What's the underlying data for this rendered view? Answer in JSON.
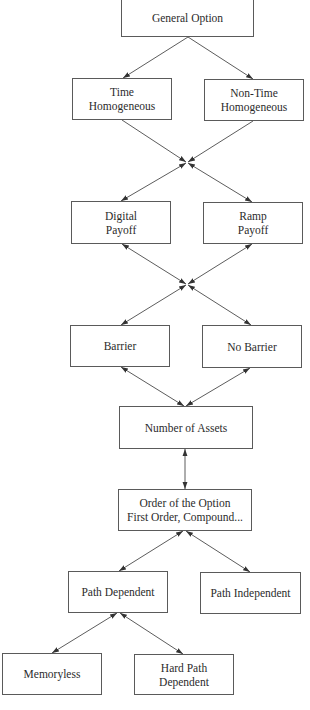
{
  "diagram": {
    "title": "",
    "nodes": {
      "general_option": {
        "lines": [
          "General Option"
        ]
      },
      "time_homogeneous": {
        "lines": [
          "Time",
          "Homogeneous"
        ]
      },
      "non_time_homogeneous": {
        "lines": [
          "Non-Time",
          "Homogeneous"
        ]
      },
      "digital_payoff": {
        "lines": [
          "Digital",
          "Payoff"
        ]
      },
      "ramp_payoff": {
        "lines": [
          "Ramp",
          "Payoff"
        ]
      },
      "barrier": {
        "lines": [
          "Barrier"
        ]
      },
      "no_barrier": {
        "lines": [
          "No Barrier"
        ]
      },
      "number_of_assets": {
        "lines": [
          "Number of Assets"
        ]
      },
      "order_of_option": {
        "lines": [
          "Order of the Option",
          "First Order, Compound..."
        ]
      },
      "path_dependent": {
        "lines": [
          "Path Dependent"
        ]
      },
      "path_independent": {
        "lines": [
          "Path Independent"
        ]
      },
      "memoryless": {
        "lines": [
          "Memoryless"
        ]
      },
      "hard_path_dependent": {
        "lines": [
          "Hard Path",
          "Dependent"
        ]
      }
    },
    "edges": [
      {
        "from": "general_option",
        "to": "time_homogeneous",
        "type": "directed"
      },
      {
        "from": "general_option",
        "to": "non_time_homogeneous",
        "type": "directed"
      },
      {
        "from": "time_homogeneous",
        "to": "junction_1",
        "type": "directed"
      },
      {
        "from": "non_time_homogeneous",
        "to": "junction_1",
        "type": "directed"
      },
      {
        "from": "junction_1",
        "to": "digital_payoff",
        "type": "bidirectional"
      },
      {
        "from": "junction_1",
        "to": "ramp_payoff",
        "type": "bidirectional"
      },
      {
        "from": "digital_payoff",
        "to": "junction_2",
        "type": "bidirectional"
      },
      {
        "from": "ramp_payoff",
        "to": "junction_2",
        "type": "bidirectional"
      },
      {
        "from": "junction_2",
        "to": "barrier",
        "type": "bidirectional"
      },
      {
        "from": "junction_2",
        "to": "no_barrier",
        "type": "bidirectional"
      },
      {
        "from": "barrier",
        "to": "number_of_assets",
        "type": "bidirectional"
      },
      {
        "from": "no_barrier",
        "to": "number_of_assets",
        "type": "bidirectional"
      },
      {
        "from": "number_of_assets",
        "to": "order_of_option",
        "type": "bidirectional"
      },
      {
        "from": "order_of_option",
        "to": "path_dependent",
        "type": "bidirectional"
      },
      {
        "from": "order_of_option",
        "to": "path_independent",
        "type": "bidirectional"
      },
      {
        "from": "path_dependent",
        "to": "memoryless",
        "type": "bidirectional"
      },
      {
        "from": "path_dependent",
        "to": "hard_path_dependent",
        "type": "bidirectional"
      }
    ],
    "colors": {
      "stroke": "#4a4a4a",
      "box_border": "#5a5a5a",
      "text": "#2b2b2b",
      "background": "#ffffff"
    }
  }
}
